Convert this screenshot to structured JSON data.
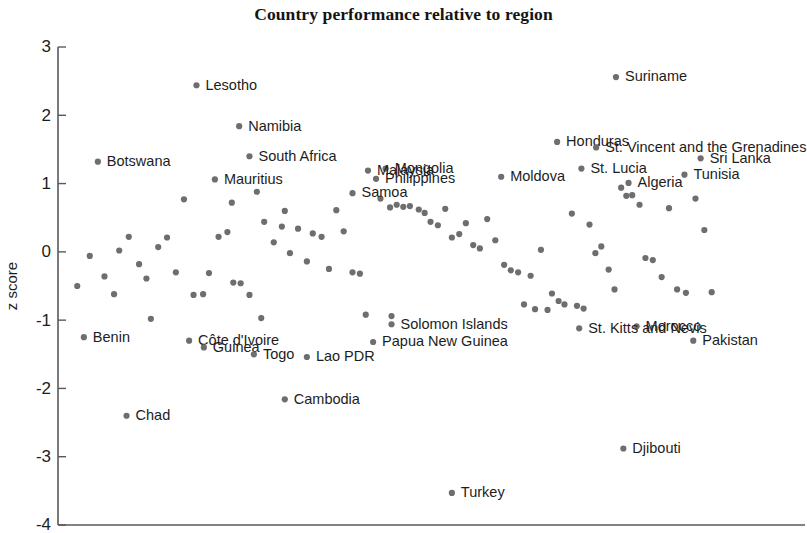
{
  "chart_data": {
    "type": "scatter",
    "title": "Country performance relative to region",
    "xlabel": "",
    "ylabel": "z score",
    "ylim": [
      -4,
      3
    ],
    "yticks": [
      3,
      2,
      1,
      0,
      -1,
      -2,
      -3,
      -4
    ],
    "ytick_labels": [
      "3",
      "2",
      "1",
      "0",
      "-1",
      "-2",
      "-3",
      "-4"
    ],
    "grid": false,
    "legend": "none",
    "x_axis_visible": true,
    "x_ticks_visible": false,
    "marker_color": "#6e6e70",
    "axis_color": "#59595b",
    "labeled_points": [
      {
        "name": "Lesotho",
        "x": 0.18,
        "y": 2.44
      },
      {
        "name": "Suriname",
        "x": 0.75,
        "y": 2.56
      },
      {
        "name": "Namibia",
        "x": 0.238,
        "y": 1.84
      },
      {
        "name": "Honduras",
        "x": 0.67,
        "y": 1.61
      },
      {
        "name": "St. Vincent and the Grenadines",
        "x": 0.723,
        "y": 1.53
      },
      {
        "name": "South Africa",
        "x": 0.252,
        "y": 1.4
      },
      {
        "name": "Mongolia",
        "x": 0.437,
        "y": 1.22
      },
      {
        "name": "Botswana",
        "x": 0.046,
        "y": 1.32
      },
      {
        "name": "Sri Lanka",
        "x": 0.865,
        "y": 1.37
      },
      {
        "name": "Malaysia",
        "x": 0.413,
        "y": 1.19
      },
      {
        "name": "St. Lucia",
        "x": 0.703,
        "y": 1.22
      },
      {
        "name": "Mauritius",
        "x": 0.205,
        "y": 1.06
      },
      {
        "name": "Philippines",
        "x": 0.424,
        "y": 1.07
      },
      {
        "name": "Moldova",
        "x": 0.594,
        "y": 1.1
      },
      {
        "name": "Algeria",
        "x": 0.767,
        "y": 1.01
      },
      {
        "name": "Tunisia",
        "x": 0.843,
        "y": 1.13
      },
      {
        "name": "Samoa",
        "x": 0.392,
        "y": 0.86
      },
      {
        "name": "Benin",
        "x": 0.027,
        "y": -1.25
      },
      {
        "name": "Solomon Islands",
        "x": 0.445,
        "y": -1.06
      },
      {
        "name": "Morocco",
        "x": 0.778,
        "y": -1.09
      },
      {
        "name": "Côte d'Ivoire",
        "x": 0.17,
        "y": -1.3
      },
      {
        "name": "Papua New Guinea",
        "x": 0.42,
        "y": -1.32
      },
      {
        "name": "St. Kitts and Nevis",
        "x": 0.7,
        "y": -1.12
      },
      {
        "name": "Guinea",
        "x": 0.19,
        "y": -1.4
      },
      {
        "name": "Togo",
        "x": 0.258,
        "y": -1.5
      },
      {
        "name": "Lao PDR",
        "x": 0.33,
        "y": -1.54
      },
      {
        "name": "Pakistan",
        "x": 0.855,
        "y": -1.3
      },
      {
        "name": "Cambodia",
        "x": 0.3,
        "y": -2.16
      },
      {
        "name": "Chad",
        "x": 0.085,
        "y": -2.4
      },
      {
        "name": "Djibouti",
        "x": 0.76,
        "y": -2.88
      },
      {
        "name": "Turkey",
        "x": 0.527,
        "y": -3.53
      }
    ],
    "unlabeled_points": [
      {
        "x": 0.018,
        "y": -0.5
      },
      {
        "x": 0.035,
        "y": -0.06
      },
      {
        "x": 0.055,
        "y": -0.36
      },
      {
        "x": 0.068,
        "y": -0.62
      },
      {
        "x": 0.088,
        "y": 0.22
      },
      {
        "x": 0.102,
        "y": -0.18
      },
      {
        "x": 0.118,
        "y": -0.98
      },
      {
        "x": 0.128,
        "y": 0.07
      },
      {
        "x": 0.14,
        "y": 0.21
      },
      {
        "x": 0.152,
        "y": -0.3
      },
      {
        "x": 0.163,
        "y": 0.77
      },
      {
        "x": 0.176,
        "y": -0.63
      },
      {
        "x": 0.189,
        "y": -0.62
      },
      {
        "x": 0.197,
        "y": -0.31
      },
      {
        "x": 0.21,
        "y": 0.22
      },
      {
        "x": 0.222,
        "y": 0.29
      },
      {
        "x": 0.23,
        "y": -0.45
      },
      {
        "x": 0.24,
        "y": -0.46
      },
      {
        "x": 0.252,
        "y": -0.63
      },
      {
        "x": 0.262,
        "y": 0.88
      },
      {
        "x": 0.272,
        "y": 0.44
      },
      {
        "x": 0.285,
        "y": 0.14
      },
      {
        "x": 0.296,
        "y": 0.37
      },
      {
        "x": 0.307,
        "y": -0.02
      },
      {
        "x": 0.318,
        "y": 0.34
      },
      {
        "x": 0.33,
        "y": -0.14
      },
      {
        "x": 0.338,
        "y": 0.27
      },
      {
        "x": 0.35,
        "y": 0.22
      },
      {
        "x": 0.36,
        "y": -0.25
      },
      {
        "x": 0.37,
        "y": 0.61
      },
      {
        "x": 0.38,
        "y": 0.3
      },
      {
        "x": 0.392,
        "y": -0.3
      },
      {
        "x": 0.402,
        "y": -0.32
      },
      {
        "x": 0.41,
        "y": -0.92
      },
      {
        "x": 0.43,
        "y": 0.78
      },
      {
        "x": 0.443,
        "y": 0.65
      },
      {
        "x": 0.452,
        "y": 0.69
      },
      {
        "x": 0.461,
        "y": 0.66
      },
      {
        "x": 0.47,
        "y": 0.67
      },
      {
        "x": 0.482,
        "y": 0.62
      },
      {
        "x": 0.49,
        "y": 0.57
      },
      {
        "x": 0.498,
        "y": 0.44
      },
      {
        "x": 0.508,
        "y": 0.39
      },
      {
        "x": 0.518,
        "y": 0.63
      },
      {
        "x": 0.527,
        "y": 0.21
      },
      {
        "x": 0.537,
        "y": 0.26
      },
      {
        "x": 0.546,
        "y": 0.42
      },
      {
        "x": 0.556,
        "y": 0.1
      },
      {
        "x": 0.565,
        "y": 0.05
      },
      {
        "x": 0.575,
        "y": 0.48
      },
      {
        "x": 0.586,
        "y": 0.17
      },
      {
        "x": 0.598,
        "y": -0.19
      },
      {
        "x": 0.607,
        "y": -0.27
      },
      {
        "x": 0.617,
        "y": -0.3
      },
      {
        "x": 0.625,
        "y": -0.77
      },
      {
        "x": 0.634,
        "y": -0.35
      },
      {
        "x": 0.64,
        "y": -0.84
      },
      {
        "x": 0.648,
        "y": 0.03
      },
      {
        "x": 0.657,
        "y": -0.85
      },
      {
        "x": 0.663,
        "y": -0.61
      },
      {
        "x": 0.672,
        "y": -0.72
      },
      {
        "x": 0.68,
        "y": -0.77
      },
      {
        "x": 0.69,
        "y": 0.56
      },
      {
        "x": 0.697,
        "y": -0.79
      },
      {
        "x": 0.706,
        "y": -0.83
      },
      {
        "x": 0.714,
        "y": 0.4
      },
      {
        "x": 0.722,
        "y": -0.02
      },
      {
        "x": 0.73,
        "y": 0.08
      },
      {
        "x": 0.74,
        "y": -0.26
      },
      {
        "x": 0.748,
        "y": -0.55
      },
      {
        "x": 0.757,
        "y": 0.94
      },
      {
        "x": 0.764,
        "y": 0.82
      },
      {
        "x": 0.772,
        "y": 0.83
      },
      {
        "x": 0.782,
        "y": 0.69
      },
      {
        "x": 0.79,
        "y": -0.09
      },
      {
        "x": 0.8,
        "y": -0.12
      },
      {
        "x": 0.812,
        "y": -0.37
      },
      {
        "x": 0.822,
        "y": 0.64
      },
      {
        "x": 0.833,
        "y": -0.55
      },
      {
        "x": 0.845,
        "y": -0.6
      },
      {
        "x": 0.858,
        "y": 0.78
      },
      {
        "x": 0.87,
        "y": 0.32
      },
      {
        "x": 0.88,
        "y": -0.59
      },
      {
        "x": 0.268,
        "y": -0.97
      },
      {
        "x": 0.445,
        "y": -0.94
      },
      {
        "x": 0.3,
        "y": 0.6
      },
      {
        "x": 0.228,
        "y": 0.72
      },
      {
        "x": 0.112,
        "y": -0.39
      },
      {
        "x": 0.075,
        "y": 0.02
      }
    ]
  }
}
